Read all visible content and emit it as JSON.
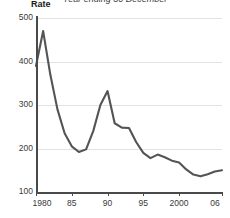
{
  "chart_data": {
    "type": "line",
    "title": "Year ending 30 December",
    "ylabel": "Rate",
    "xlabel": "",
    "ylim": [
      100,
      500
    ],
    "xlim": [
      1980,
      2006
    ],
    "grid": true,
    "legend": "none",
    "y_ticks": [
      100,
      200,
      300,
      400,
      500
    ],
    "y_tick_labels": [
      "100",
      "200",
      "300",
      "400",
      "500"
    ],
    "x_ticks": [
      1980,
      1985,
      1990,
      1995,
      2000,
      2006
    ],
    "x_tick_labels": [
      "1980",
      "85",
      "90",
      "95",
      "2000",
      "06"
    ],
    "series": [
      {
        "name": "Rate",
        "color": "#545454",
        "x": [
          1980,
          1981,
          1982,
          1983,
          1984,
          1985,
          1986,
          1987,
          1988,
          1989,
          1990,
          1991,
          1992,
          1993,
          1994,
          1995,
          1996,
          1997,
          1998,
          1999,
          2000,
          2001,
          2002,
          2003,
          2004,
          2005,
          2006
        ],
        "values": [
          390,
          470,
          370,
          290,
          235,
          205,
          192,
          198,
          240,
          300,
          332,
          258,
          248,
          247,
          215,
          190,
          178,
          186,
          180,
          172,
          168,
          152,
          140,
          136,
          141,
          147,
          150
        ]
      }
    ]
  }
}
